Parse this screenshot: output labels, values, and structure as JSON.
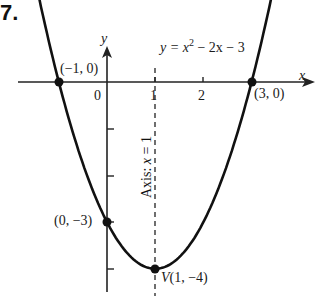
{
  "problem_number": "7.",
  "chart_data": {
    "type": "line",
    "equation": {
      "prefix": "y = x",
      "exp": "2",
      "suffix": " − 2x − 3"
    },
    "xlabel": "x",
    "ylabel": "y",
    "x_ticks": [
      {
        "value": 0,
        "label": "0"
      },
      {
        "value": 1,
        "label": "1"
      },
      {
        "value": 2,
        "label": "2"
      }
    ],
    "y_ticks": [
      -1,
      -2,
      -3,
      -4
    ],
    "xlim": [
      -1.6,
      3.4
    ],
    "ylim": [
      -4.6,
      1.7
    ],
    "grid": false,
    "axis_of_symmetry": {
      "x": 1,
      "label_prefix": "Axis: ",
      "label_var": "x",
      "label_suffix": " = 1",
      "style": "dashed"
    },
    "points": [
      {
        "x": -1,
        "y": 0,
        "label": "(−1, 0)"
      },
      {
        "x": 3,
        "y": 0,
        "label": "(3, 0)"
      },
      {
        "x": 0,
        "y": -3,
        "label": "(0, −3)"
      },
      {
        "x": 1,
        "y": -4,
        "label_prefix": "V",
        "label": "(1, −4)"
      }
    ],
    "curve": {
      "function": "x^2 - 2x - 3",
      "x_range": [
        -1.45,
        3.45
      ]
    }
  }
}
